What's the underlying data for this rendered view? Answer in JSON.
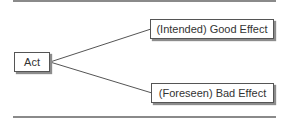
{
  "diagram": {
    "nodes": [
      {
        "id": "act",
        "label": "Act"
      },
      {
        "id": "good",
        "label": "(Intended) Good Effect"
      },
      {
        "id": "bad",
        "label": "(Foreseen) Bad Effect"
      }
    ],
    "edges": [
      {
        "from": "act",
        "to": "good"
      },
      {
        "from": "act",
        "to": "bad"
      }
    ],
    "colors": {
      "rule": "#8a8a8a",
      "line": "#555555",
      "box_border": "#555555",
      "shadow": "#8c8c8c"
    }
  }
}
